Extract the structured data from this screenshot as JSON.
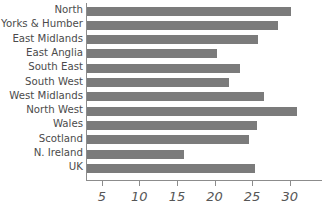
{
  "chart_data": {
    "type": "bar",
    "orientation": "horizontal",
    "title": "",
    "xlabel": "",
    "ylabel": "",
    "categories": [
      "North",
      "Yorks & Humber",
      "East Midlands",
      "East Anglia",
      "South East",
      "South West",
      "West Midlands",
      "North West",
      "Wales",
      "Scotland",
      "N. Ireland",
      "UK"
    ],
    "values": [
      30.1,
      28.3,
      25.6,
      20.2,
      23.3,
      21.8,
      26.5,
      30.9,
      25.5,
      24.4,
      15.8,
      25.3
    ],
    "xticks": [
      5,
      10,
      15,
      20,
      25,
      30
    ],
    "xtick_labels": [
      "5",
      "10",
      "15",
      "20",
      "25",
      "30"
    ],
    "xlim": [
      2.9,
      34.3
    ],
    "grid": false,
    "legend": null,
    "bar_color": "#7b7b7b",
    "axis_color": "#8c8c8c",
    "label_color": "#4b4b4b",
    "tick_label_color": "#565656",
    "background": "#ffffff"
  }
}
